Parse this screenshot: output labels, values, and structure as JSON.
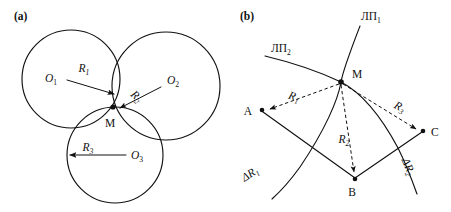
{
  "figure": {
    "background_color": "#ffffff",
    "ink_color": "#111111",
    "panels": [
      {
        "key": "a",
        "label": "(a)",
        "label_pos": {
          "x": 14,
          "y": 20
        },
        "description": "three overlapping circles intersecting at a common point M",
        "point_labels": [
          {
            "name": "O1",
            "base": "O",
            "sub": "1",
            "x": 57,
            "y": 82
          },
          {
            "name": "O2",
            "base": "O",
            "sub": "2",
            "x": 167,
            "y": 84
          },
          {
            "name": "O3",
            "base": "O",
            "sub": "3",
            "x": 131,
            "y": 158
          },
          {
            "name": "M",
            "base": "M",
            "sub": "",
            "x": 108,
            "y": 125
          }
        ],
        "radius_labels": [
          {
            "name": "R1",
            "base": "R",
            "sub": "1",
            "x": 84,
            "y": 72,
            "rotate": 0
          },
          {
            "name": "R2",
            "base": "R",
            "sub": "2",
            "x": 131,
            "y": 97,
            "rotate": 42
          },
          {
            "name": "R3",
            "base": "R",
            "sub": "3",
            "x": 86,
            "y": 150,
            "rotate": 0
          }
        ],
        "circles": [
          {
            "name": "circle-1",
            "cx": 71,
            "cy": 79,
            "r": 49
          },
          {
            "name": "circle-2",
            "cx": 166,
            "cy": 86,
            "r": 54
          },
          {
            "name": "circle-3",
            "cx": 115,
            "cy": 155,
            "r": 48
          }
        ],
        "arrows": [
          {
            "name": "radius-arrow-1",
            "x1": 67,
            "y1": 80,
            "x2": 117,
            "y2": 95
          },
          {
            "name": "radius-arrow-2",
            "x1": 161,
            "y1": 87,
            "x2": 117,
            "y2": 110
          },
          {
            "name": "radius-arrow-3",
            "x1": 124,
            "y1": 155,
            "x2": 67,
            "y2": 155
          }
        ],
        "intersection_point": {
          "name": "M",
          "x": 113,
          "y": 107
        }
      },
      {
        "key": "b",
        "label": "(b)",
        "label_pos": {
          "x": 240,
          "y": 20
        },
        "description": "two position lines crossing at M with dashed ranges R1 R2 R3 to points A B C",
        "curve_labels": [
          {
            "name": "LP1",
            "base": "ЛП",
            "sub": "1",
            "x": 362,
            "y": 19,
            "rotate": 0
          },
          {
            "name": "LP2",
            "base": "ЛП",
            "sub": "2",
            "x": 272,
            "y": 51,
            "rotate": 0
          },
          {
            "name": "dR1",
            "base": "ΔR",
            "sub": "1",
            "x": 247,
            "y": 177,
            "rotate": -30
          },
          {
            "name": "dR2",
            "base": "ΔR",
            "sub": "2",
            "x": 404,
            "y": 167,
            "rotate": 68
          }
        ],
        "point_labels": [
          {
            "name": "M",
            "base": "M",
            "sub": "",
            "x": 352,
            "y": 77
          },
          {
            "name": "A",
            "base": "A",
            "sub": "",
            "x": 251,
            "y": 113
          },
          {
            "name": "B",
            "base": "B",
            "sub": "",
            "x": 348,
            "y": 192
          },
          {
            "name": "C",
            "base": "C",
            "sub": "",
            "x": 432,
            "y": 135
          }
        ],
        "range_labels": [
          {
            "name": "R1",
            "base": "R",
            "sub": "1",
            "x": 291,
            "y": 99,
            "rotate": 17
          },
          {
            "name": "R2",
            "base": "R",
            "sub": "2",
            "x": 343,
            "y": 141,
            "rotate": 0
          },
          {
            "name": "R3",
            "base": "R",
            "sub": "3",
            "x": 397,
            "y": 109,
            "rotate": 27
          }
        ],
        "vertices": {
          "M": {
            "x": 341,
            "y": 82
          },
          "A": {
            "x": 262,
            "y": 110
          },
          "B": {
            "x": 355,
            "y": 180
          },
          "C": {
            "x": 424,
            "y": 131
          }
        }
      }
    ]
  }
}
